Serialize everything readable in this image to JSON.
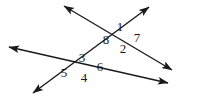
{
  "figure": {
    "type": "geometry-diagram",
    "width": 198,
    "height": 101,
    "background_color": "#ffffff",
    "line_color": "#1a1a1a",
    "label_color": "#1a1a1a",
    "line_width": 1.4,
    "lines": [
      {
        "id": "line-transversal",
        "name": "transversal-line",
        "from": {
          "x": 33,
          "y": 93
        },
        "to": {
          "x": 149,
          "y": 7
        },
        "arrow_start": true,
        "arrow_end": true
      },
      {
        "id": "line-upper",
        "name": "upper-line",
        "from": {
          "x": 64,
          "y": 6
        },
        "to": {
          "x": 172,
          "y": 70
        },
        "arrow_start": true,
        "arrow_end": true
      },
      {
        "id": "line-lower",
        "name": "lower-line",
        "from": {
          "x": 9,
          "y": 47
        },
        "to": {
          "x": 168,
          "y": 83
        },
        "arrow_start": true,
        "arrow_end": true
      }
    ],
    "intersections": [
      {
        "id": "upper-intersection",
        "x": 114,
        "y": 35
      },
      {
        "id": "lower-intersection",
        "x": 76,
        "y": 66
      }
    ],
    "angle_labels": [
      {
        "id": "angle-1",
        "text": "1",
        "x": 113,
        "y": 20
      },
      {
        "id": "angle-7",
        "text": "7",
        "x": 130,
        "y": 31
      },
      {
        "id": "angle-8",
        "text": "8",
        "x": 99,
        "y": 33
      },
      {
        "id": "angle-2",
        "text": "2",
        "x": 116,
        "y": 42
      },
      {
        "id": "angle-3",
        "text": "3",
        "x": 75,
        "y": 51
      },
      {
        "id": "angle-6",
        "text": "6",
        "x": 93,
        "y": 60
      },
      {
        "id": "angle-5",
        "text": "5",
        "x": 57,
        "y": 66
      },
      {
        "id": "angle-4",
        "text": "4",
        "x": 77,
        "y": 71
      }
    ]
  }
}
